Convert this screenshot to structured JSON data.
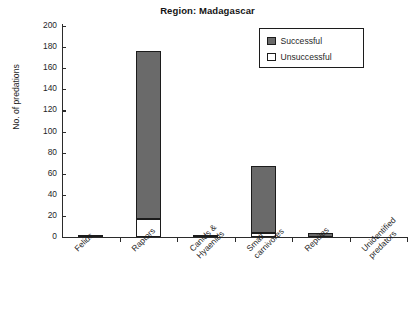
{
  "chart_data": {
    "type": "bar",
    "title": "Region: Madagascar",
    "xlabel": "",
    "ylabel": "No. of predations",
    "ylim": [
      0,
      200
    ],
    "yticks": [
      0,
      20,
      40,
      60,
      80,
      100,
      120,
      140,
      160,
      180,
      200
    ],
    "grid": false,
    "stacked": true,
    "legend_position": "top-right",
    "categories": [
      "Felids",
      "Raptors",
      "Canids &\nHyaenids",
      "Small\ncarnivores",
      "Reptiles",
      "Unidentified\npredators"
    ],
    "series": [
      {
        "name": "Unsuccessful",
        "color": "#ffffff",
        "values": [
          0,
          17,
          0,
          4,
          0,
          0
        ]
      },
      {
        "name": "Successful",
        "color": "#6a6a6a",
        "values": [
          2,
          159,
          2,
          63,
          4,
          0
        ]
      }
    ],
    "totals": [
      2,
      176,
      2,
      67,
      4,
      0
    ]
  },
  "legend": {
    "items": [
      {
        "label": "Successful",
        "swatch": "filled-gray"
      },
      {
        "label": "Unsuccessful",
        "swatch": "empty-white"
      }
    ]
  },
  "axes": {
    "y_tick_labels": [
      "200",
      "180",
      "160",
      "140",
      "120",
      "100",
      "80",
      "60",
      "40",
      "20",
      "0"
    ],
    "y_axis_title": "No. of predations"
  },
  "colors": {
    "successful": "#6a6a6a",
    "unsuccessful": "#ffffff",
    "outline": "#1c1c1c",
    "axis": "#2b2b2b",
    "text": "#1f1f1f",
    "background": "#ffffff"
  }
}
